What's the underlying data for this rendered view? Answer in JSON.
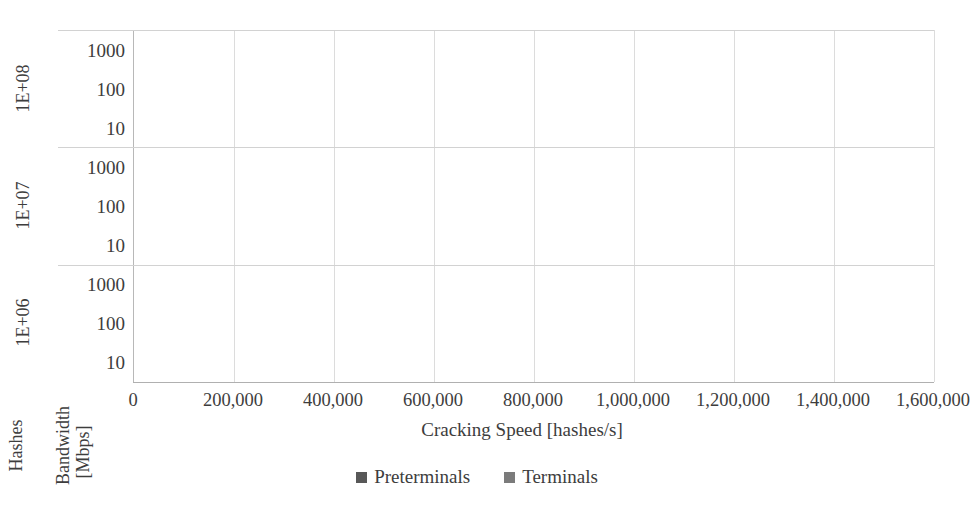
{
  "chart_data": {
    "type": "bar",
    "orientation": "horizontal",
    "title": "",
    "xlabel": "Cracking Speed [hashes/s]",
    "ylabel_outer": "Hashes",
    "ylabel_inner": "Bandwidth [Mbps]",
    "xlim": [
      0,
      1600000
    ],
    "xticks": [
      0,
      200000,
      400000,
      600000,
      800000,
      1000000,
      1200000,
      1400000,
      1600000
    ],
    "xticklabels": [
      "0",
      "200,000",
      "400,000",
      "600,000",
      "800,000",
      "1,000,000",
      "1,200,000",
      "1,400,000",
      "1,600,000"
    ],
    "grid": true,
    "legend_position": "bottom",
    "legend": [
      "Preterminals",
      "Terminals"
    ],
    "colors": {
      "preterminals": "#585858",
      "terminals": "#7b7b7b",
      "gridline": "#dcdcdc",
      "axis": "#b0b0b0"
    },
    "groups": [
      {
        "label": "1E+08",
        "categories": [
          "1000",
          "100",
          "10"
        ],
        "series": [
          {
            "name": "Preterminals",
            "values": [
              1470000,
              1290000,
              688000
            ]
          },
          {
            "name": "Terminals",
            "values": [
              1300000,
              483000,
              55000
            ]
          }
        ]
      },
      {
        "label": "1E+07",
        "categories": [
          "1000",
          "100",
          "10"
        ],
        "series": [
          {
            "name": "Preterminals",
            "values": [
              500000,
              470000,
              360000
            ]
          },
          {
            "name": "Terminals",
            "values": [
              440000,
              235000,
              50000
            ]
          }
        ]
      },
      {
        "label": "1E+06",
        "categories": [
          "1000",
          "100",
          "10"
        ],
        "series": [
          {
            "name": "Preterminals",
            "values": [
              100000,
              98000,
              95000
            ]
          },
          {
            "name": "Terminals",
            "values": [
              88000,
              60000,
              33000
            ]
          }
        ]
      }
    ]
  }
}
